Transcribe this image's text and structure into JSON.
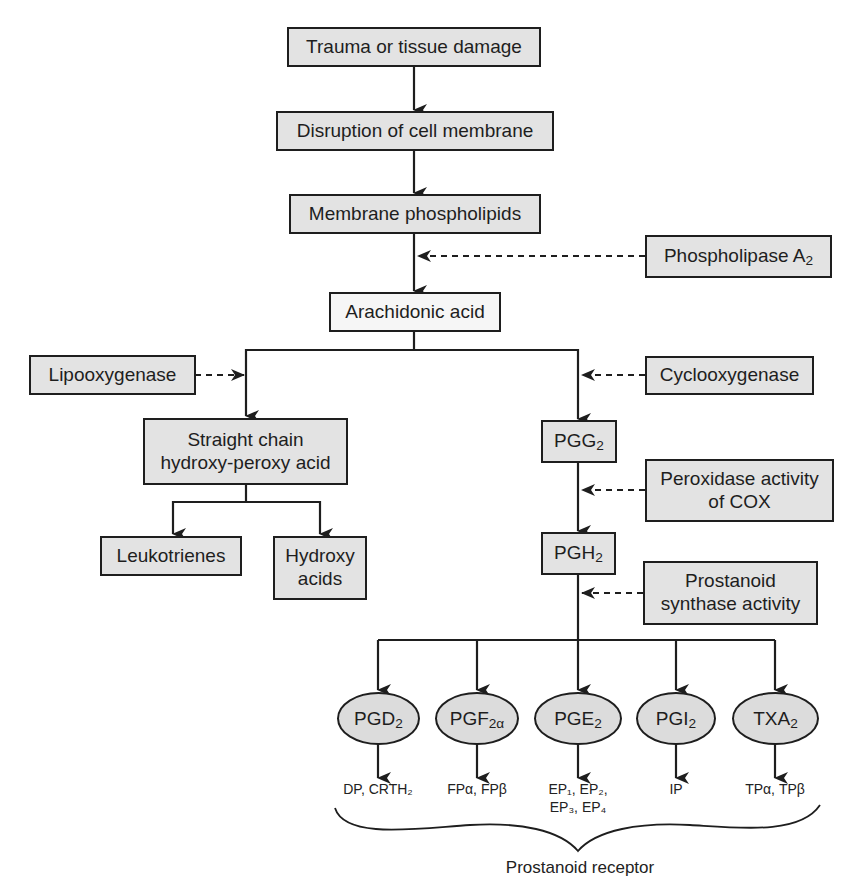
{
  "diagram": {
    "colors": {
      "box_fill": "#e3e3e3",
      "highlight_fill": "#f6f6f6",
      "ellipse_fill": "#dcdcdc",
      "line": "#1e1e1e"
    },
    "main_chain": [
      {
        "id": "trauma",
        "label": "Trauma or tissue damage"
      },
      {
        "id": "disruption",
        "label": "Disruption of cell membrane"
      },
      {
        "id": "phospholipids",
        "label": "Membrane phospholipids"
      },
      {
        "id": "arachidonic",
        "label": "Arachidonic acid"
      }
    ],
    "enzymes": {
      "phospholipase": {
        "label": "Phospholipase A",
        "sub": "2"
      },
      "lipooxygenase": {
        "label": "Lipooxygenase"
      },
      "cyclooxygenase": {
        "label": "Cyclooxygenase"
      },
      "peroxidase": {
        "line1": "Peroxidase activity",
        "line2": "of COX"
      },
      "synthase": {
        "line1": "Prostanoid",
        "line2": "synthase activity"
      }
    },
    "lox_branch": {
      "intermediate": {
        "line1": "Straight chain",
        "line2": "hydroxy-peroxy acid"
      },
      "products": [
        {
          "label": "Leukotrienes"
        },
        {
          "line1": "Hydroxy",
          "line2": "acids"
        }
      ]
    },
    "cox_branch": {
      "pgg2": {
        "label": "PGG",
        "sub": "2"
      },
      "pgh2": {
        "label": "PGH",
        "sub": "2"
      }
    },
    "prostanoids": [
      {
        "label": "PGD",
        "sub": "2",
        "receptors": "DP, CRTH₂"
      },
      {
        "label": "PGF",
        "sub": "2α",
        "receptors": "FPα, FPβ"
      },
      {
        "label": "PGE",
        "sub": "2",
        "receptors": "EP₁, EP₂,",
        "receptors_line2": "EP₃, EP₄"
      },
      {
        "label": "PGI",
        "sub": "2",
        "receptors": "IP"
      },
      {
        "label": "TXA",
        "sub": "2",
        "receptors": "TPα, TPβ"
      }
    ],
    "brace_label": "Prostanoid receptor"
  }
}
